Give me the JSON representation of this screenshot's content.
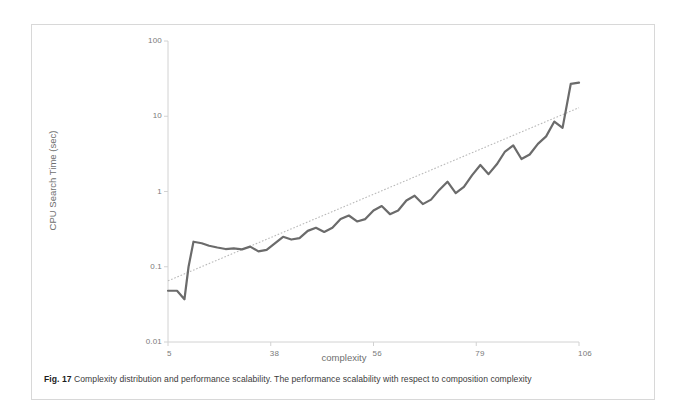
{
  "figure": {
    "caption_label": "Fig. 17",
    "caption_text": "Complexity distribution and performance scalability. The performance scalability with respect to composition complexity"
  },
  "colors": {
    "series_line": "#6b6b6b",
    "trend_line": "#b9b9b9",
    "axis": "#d2d2d2",
    "tick_text": "#7a7a7a",
    "axis_title": "#6e6e6e",
    "card_border": "#d8d8d8",
    "background": "#ffffff"
  },
  "chart_data": {
    "type": "line",
    "title": "",
    "subtitle": "",
    "xlabel": "complexity",
    "ylabel": "CPU Search Time (sec)",
    "yscale": "log",
    "ylim": [
      0.01,
      100
    ],
    "ytick_labels": [
      "100",
      "10",
      "1",
      "0.1",
      "0.01"
    ],
    "ytick_values": [
      100,
      10,
      1,
      0.1,
      0.01
    ],
    "xtick_labels": [
      "5",
      "38",
      "56",
      "79",
      "106"
    ],
    "xtick_positions": [
      0,
      0.25,
      0.5,
      0.75,
      1.0
    ],
    "grid": false,
    "legend": "none",
    "series": [
      {
        "name": "CPU Search Time",
        "style": "solid",
        "color": "#6b6b6b",
        "x": [
          0.0,
          0.022,
          0.04,
          0.05,
          0.062,
          0.082,
          0.1,
          0.12,
          0.14,
          0.16,
          0.18,
          0.2,
          0.22,
          0.24,
          0.26,
          0.28,
          0.3,
          0.32,
          0.34,
          0.36,
          0.38,
          0.4,
          0.42,
          0.44,
          0.46,
          0.48,
          0.5,
          0.52,
          0.54,
          0.56,
          0.58,
          0.6,
          0.62,
          0.64,
          0.66,
          0.68,
          0.7,
          0.72,
          0.74,
          0.76,
          0.78,
          0.8,
          0.82,
          0.84,
          0.86,
          0.88,
          0.9,
          0.92,
          0.94,
          0.96,
          0.98,
          1.0
        ],
        "values": [
          0.048,
          0.048,
          0.037,
          0.1,
          0.215,
          0.205,
          0.19,
          0.18,
          0.172,
          0.175,
          0.17,
          0.185,
          0.16,
          0.168,
          0.205,
          0.25,
          0.23,
          0.24,
          0.3,
          0.33,
          0.29,
          0.33,
          0.43,
          0.48,
          0.4,
          0.43,
          0.56,
          0.64,
          0.5,
          0.56,
          0.76,
          0.88,
          0.68,
          0.78,
          1.05,
          1.35,
          0.95,
          1.15,
          1.65,
          2.25,
          1.7,
          2.3,
          3.4,
          4.1,
          2.7,
          3.1,
          4.3,
          5.4,
          8.5,
          7.0,
          27.0,
          28.0
        ]
      },
      {
        "name": "Trend",
        "style": "dotted",
        "color": "#b9b9b9",
        "x": [
          0.0,
          1.0
        ],
        "values": [
          0.065,
          13.0
        ]
      }
    ]
  }
}
